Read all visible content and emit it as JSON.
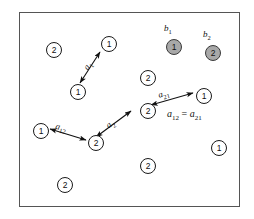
{
  "figure": {
    "title": "",
    "frame": {
      "x": 19,
      "y": 12,
      "width": 221,
      "height": 195,
      "border_color": "#555555",
      "background": "#ffffff"
    },
    "colors": {
      "node_fill": "#ffffff",
      "node_stroke": "#1a1a1a",
      "shaded_fill": "#a8a8a8",
      "arrow": "#111111",
      "text": "#111111"
    }
  },
  "nodes": [
    {
      "id": "n1",
      "label": "2",
      "x": 46,
      "y": 42,
      "shaded": false
    },
    {
      "id": "n2",
      "label": "1",
      "x": 101,
      "y": 36,
      "shaded": false
    },
    {
      "id": "n3",
      "label": "1",
      "x": 70,
      "y": 84,
      "shaded": false
    },
    {
      "id": "n4",
      "label": "1",
      "x": 166,
      "y": 39,
      "shaded": true,
      "caption": "b1"
    },
    {
      "id": "n5",
      "label": "2",
      "x": 205,
      "y": 45,
      "shaded": true,
      "caption": "b2"
    },
    {
      "id": "n6",
      "label": "2",
      "x": 140,
      "y": 70,
      "shaded": false
    },
    {
      "id": "n7",
      "label": "1",
      "x": 196,
      "y": 88,
      "shaded": false
    },
    {
      "id": "n8",
      "label": "2",
      "x": 140,
      "y": 103,
      "shaded": false
    },
    {
      "id": "n9",
      "label": "1",
      "x": 33,
      "y": 123,
      "shaded": false
    },
    {
      "id": "n10",
      "label": "2",
      "x": 88,
      "y": 135,
      "shaded": false
    },
    {
      "id": "n11",
      "label": "1",
      "x": 211,
      "y": 140,
      "shaded": false
    },
    {
      "id": "n12",
      "label": "2",
      "x": 140,
      "y": 158,
      "shaded": false
    },
    {
      "id": "n13",
      "label": "2",
      "x": 57,
      "y": 177,
      "shaded": false
    }
  ],
  "node_captions": [
    {
      "for": "n4",
      "text": "b",
      "sub": "1",
      "x": 164,
      "y": 25
    },
    {
      "for": "n5",
      "text": "b",
      "sub": "2",
      "x": 203,
      "y": 31
    }
  ],
  "edges": [
    {
      "id": "e1",
      "from": "n3",
      "to": "n2",
      "label": "a",
      "sub": "1",
      "double_headed": true,
      "x1": 80,
      "y1": 83,
      "x2": 100,
      "y2": 52,
      "label_x": 81,
      "label_y": 66,
      "label_rotate": -56
    },
    {
      "id": "e2",
      "from": "n9",
      "to": "n10",
      "label": "a",
      "sub": "12",
      "double_headed": true,
      "x1": 50,
      "y1": 129,
      "x2": 88,
      "y2": 141,
      "label_x": 57,
      "label_y": 123,
      "label_rotate": 14
    },
    {
      "id": "e3",
      "from": "n10",
      "to": "n8",
      "label": "a",
      "sub": "2",
      "double_headed": true,
      "x1": 97,
      "y1": 136,
      "x2": 132,
      "y2": 110,
      "label_x": 105,
      "label_y": 122,
      "label_rotate": -35
    },
    {
      "id": "e4",
      "from": "n8",
      "to": "n7",
      "label": "a",
      "sub": "21",
      "double_headed": true,
      "x1": 150,
      "y1": 104,
      "x2": 193,
      "y2": 92,
      "label_x": 157,
      "label_y": 92,
      "label_rotate": -14
    }
  ],
  "annotations": [
    {
      "id": "eq1",
      "lhs": "a",
      "lhs_sub": "12",
      "operator": "=",
      "rhs": "a",
      "rhs_sub": "21",
      "x": 167,
      "y": 110
    }
  ]
}
